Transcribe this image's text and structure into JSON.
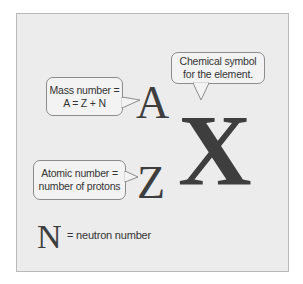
{
  "diagram": {
    "symbols": {
      "mass_number": "A",
      "atomic_number": "Z",
      "element": "X",
      "neutron": "N"
    },
    "callouts": {
      "chemical_symbol": {
        "line1": "Chemical symbol",
        "line2": "for the element."
      },
      "mass_number": {
        "line1": "Mass number =",
        "line2": "A = Z + N"
      },
      "atomic_number": {
        "line1": "Atomic number =",
        "line2": "number of protons"
      }
    },
    "neutron_label": "= neutron number"
  },
  "colors": {
    "background": "#ececec",
    "bubble_fill": "#f3f3f3",
    "bubble_border": "#8c8c8c",
    "symbol": "#3e3e3e"
  }
}
